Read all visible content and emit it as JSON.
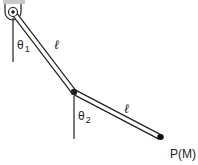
{
  "diagram": {
    "labels": {
      "theta1": "θ",
      "theta1_sub": "1",
      "theta2": "θ",
      "theta2_sub": "2",
      "rod1_length": "ℓ",
      "rod2_length": "ℓ",
      "end_point": "P(M)"
    },
    "colors": {
      "ceiling": "#c8c8c8",
      "stroke": "#222222",
      "rod_fill": "#ffffff"
    }
  }
}
